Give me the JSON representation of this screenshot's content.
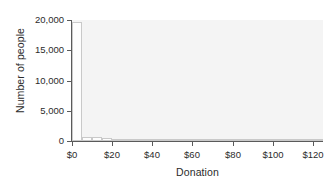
{
  "chart_data": {
    "type": "bar",
    "title": "",
    "xlabel": "Donation",
    "ylabel": "Number of people",
    "xlim": [
      0,
      125
    ],
    "ylim": [
      0,
      20000
    ],
    "grid": false,
    "legend": false,
    "xticks": [
      "$0",
      "$20",
      "$40",
      "$60",
      "$80",
      "$100",
      "$120"
    ],
    "xtick_values": [
      0,
      20,
      40,
      60,
      80,
      100,
      120
    ],
    "yticks": [
      "0",
      "5,000",
      "10,000",
      "15,000",
      "20,000"
    ],
    "ytick_values": [
      0,
      5000,
      10000,
      15000,
      20000
    ],
    "bin_width": 5,
    "bin_edges": [
      0,
      5,
      10,
      15,
      20,
      25,
      30,
      35,
      40,
      45,
      50,
      55,
      60,
      65,
      70,
      75,
      80,
      85,
      90,
      95,
      100,
      105,
      110,
      115,
      120,
      125
    ],
    "categories": [
      "$0-$5",
      "$5-$10",
      "$10-$15",
      "$15-$20",
      "$20-$25",
      "$25-$30",
      "$30-$35",
      "$35-$40",
      "$40-$45",
      "$45-$50",
      "$50-$55",
      "$55-$60",
      "$60-$65",
      "$65-$70",
      "$70-$75",
      "$75-$80",
      "$80-$85",
      "$85-$90",
      "$90-$95",
      "$95-$100",
      "$100-$105",
      "$105-$110",
      "$110-$115",
      "$115-$120",
      "$120-$125"
    ],
    "values": [
      19700,
      700,
      620,
      430,
      330,
      180,
      60,
      40,
      25,
      18,
      14,
      12,
      10,
      8,
      7,
      6,
      5,
      4,
      4,
      3,
      3,
      2,
      2,
      2,
      1
    ],
    "bar_facecolor": "#fdfdfd",
    "bar_edgecolor": "#c9c9c9",
    "plot_background": "#f4f4f4",
    "axis_color": "#5a5a5a"
  }
}
